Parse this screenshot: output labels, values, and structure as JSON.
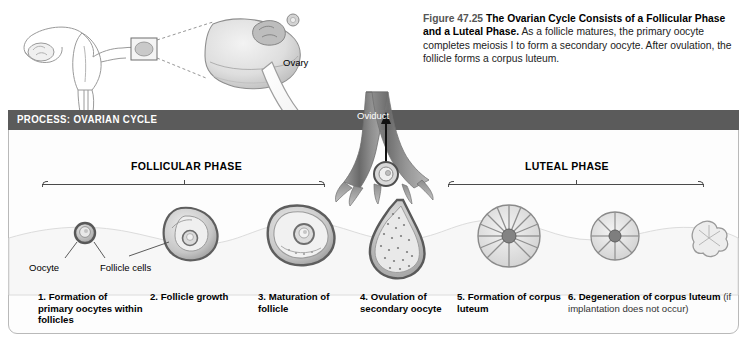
{
  "caption": {
    "figure_number": "Figure 47.25",
    "title": "The Ovarian Cycle Consists of a Follicular Phase and a Luteal Phase.",
    "body": "As a follicle matures, the primary oocyte completes meiosis I to form a secondary oocyte. After ovulation, the follicle forms a corpus luteum."
  },
  "process": {
    "header": "PROCESS: OVARIAN CYCLE",
    "header_bg": "#5b5b5b",
    "header_text_color": "#ffffff",
    "border_color": "#b9b9b9"
  },
  "phases": [
    {
      "label": "FOLLICULAR PHASE"
    },
    {
      "label": "LUTEAL PHASE"
    }
  ],
  "anatomy_labels": {
    "ovary": "Ovary",
    "oviduct": "Oviduct",
    "oocyte": "Oocyte",
    "follicle_cells": "Follicle cells"
  },
  "steps": [
    {
      "number": "1.",
      "text": "Formation of primary oocytes within follicles",
      "note": ""
    },
    {
      "number": "2.",
      "text": "Follicle growth",
      "note": ""
    },
    {
      "number": "3.",
      "text": "Maturation of follicle",
      "note": ""
    },
    {
      "number": "4.",
      "text": "Ovulation of secondary oocyte",
      "note": ""
    },
    {
      "number": "5.",
      "text": "Formation of corpus luteum",
      "note": ""
    },
    {
      "number": "6.",
      "text": "Degeneration of corpus luteum",
      "note": "(if implantation does not occur)"
    }
  ],
  "step_labels": {
    "s1": "1. Formation of primary oocytes within follicles",
    "s2": "2. Follicle growth",
    "s3": "3. Maturation of follicle",
    "s4": "4. Ovulation of secondary oocyte",
    "s5": "5. Formation of corpus luteum",
    "s6": "6. Degeneration of corpus luteum",
    "s6note": "(if implantation does not occur)"
  }
}
